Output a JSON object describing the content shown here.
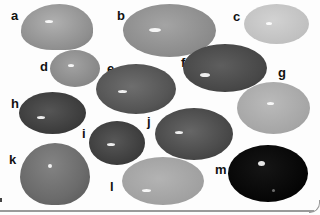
{
  "figure": {
    "labels": [
      "a",
      "b",
      "c",
      "d",
      "e",
      "f",
      "g",
      "h",
      "i",
      "j",
      "k",
      "l",
      "m"
    ],
    "stones": [
      {
        "id": "a",
        "tone": "#9b9b9b"
      },
      {
        "id": "b",
        "tone": "#8f8f8f"
      },
      {
        "id": "c",
        "tone": "#c4c4c4"
      },
      {
        "id": "d",
        "tone": "#8c8c8c"
      },
      {
        "id": "e",
        "tone": "#5a5a5a"
      },
      {
        "id": "f",
        "tone": "#4a4a4a"
      },
      {
        "id": "g",
        "tone": "#a8a8a8"
      },
      {
        "id": "h",
        "tone": "#3e3e3e"
      },
      {
        "id": "i",
        "tone": "#3f3f3f"
      },
      {
        "id": "j",
        "tone": "#4c4c4c"
      },
      {
        "id": "k",
        "tone": "#6e6e6e"
      },
      {
        "id": "l",
        "tone": "#a3a3a3"
      },
      {
        "id": "m",
        "tone": "#050505"
      }
    ]
  }
}
